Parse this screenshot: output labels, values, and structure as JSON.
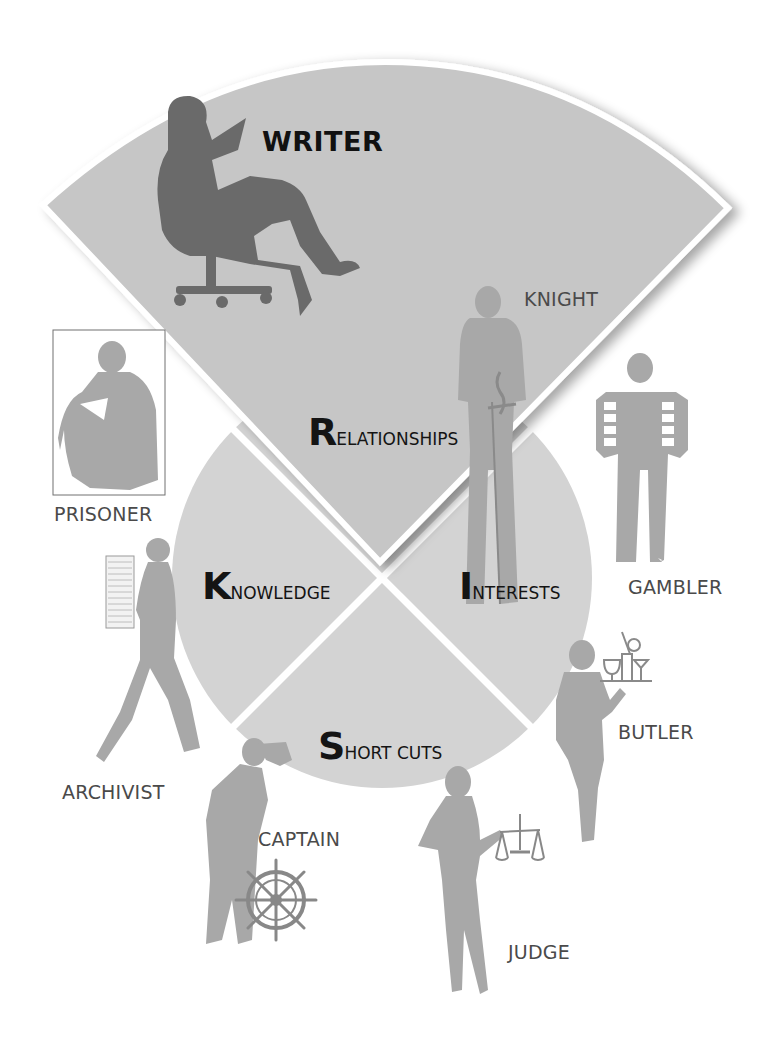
{
  "diagram": {
    "central_circle": {
      "quadrants": [
        {
          "id": "knowledge",
          "initial": "K",
          "rest": "NOWLEDGE",
          "full": "KNOWLEDGE"
        },
        {
          "id": "interests",
          "initial": "I",
          "rest": "NTERESTS",
          "full": "INTERESTS"
        },
        {
          "id": "short-cuts",
          "initial": "S",
          "rest": "HORT CUTS",
          "full": "SHORT CUTS"
        }
      ]
    },
    "top_wedge": {
      "category": {
        "id": "relationships",
        "initial": "R",
        "rest": "ELATIONSHIPS",
        "full": "RELATIONSHIPS"
      },
      "title": "WRITER"
    },
    "roles": {
      "writer": "WRITER",
      "knight": "KNIGHT",
      "prisoner": "PRISONER",
      "gambler": "GAMBLER",
      "archivist": "ARCHIVIST",
      "butler": "BUTLER",
      "captain": "CAPTAIN",
      "judge": "JUDGE"
    },
    "colors": {
      "background": "#ffffff",
      "circle_fill": "#d3d3d3",
      "wedge_fill": "#c6c6c6",
      "divider": "#ffffff",
      "writer_silhouette": "#6a6a6a",
      "silhouette": "#a8a8a8",
      "label_dark": "#141414",
      "label_role": "#4a4a4a"
    }
  }
}
